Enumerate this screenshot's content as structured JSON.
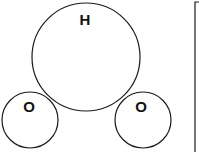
{
  "diagram": {
    "type": "molecule-circles",
    "atoms": [
      {
        "id": "center",
        "label": "H",
        "cx": 86,
        "cy": 57,
        "r": 54,
        "label_x": 85,
        "label_y": 25
      },
      {
        "id": "left",
        "label": "O",
        "cx": 30,
        "cy": 120,
        "r": 28,
        "label_x": 29,
        "label_y": 112
      },
      {
        "id": "right",
        "label": "O",
        "cx": 143,
        "cy": 120,
        "r": 28,
        "label_x": 141,
        "label_y": 112
      }
    ],
    "bracket": {
      "x": 195,
      "y_top": 2,
      "y_bottom": 152,
      "tick_to": 199
    },
    "stroke_color": "#1a1a1a"
  }
}
